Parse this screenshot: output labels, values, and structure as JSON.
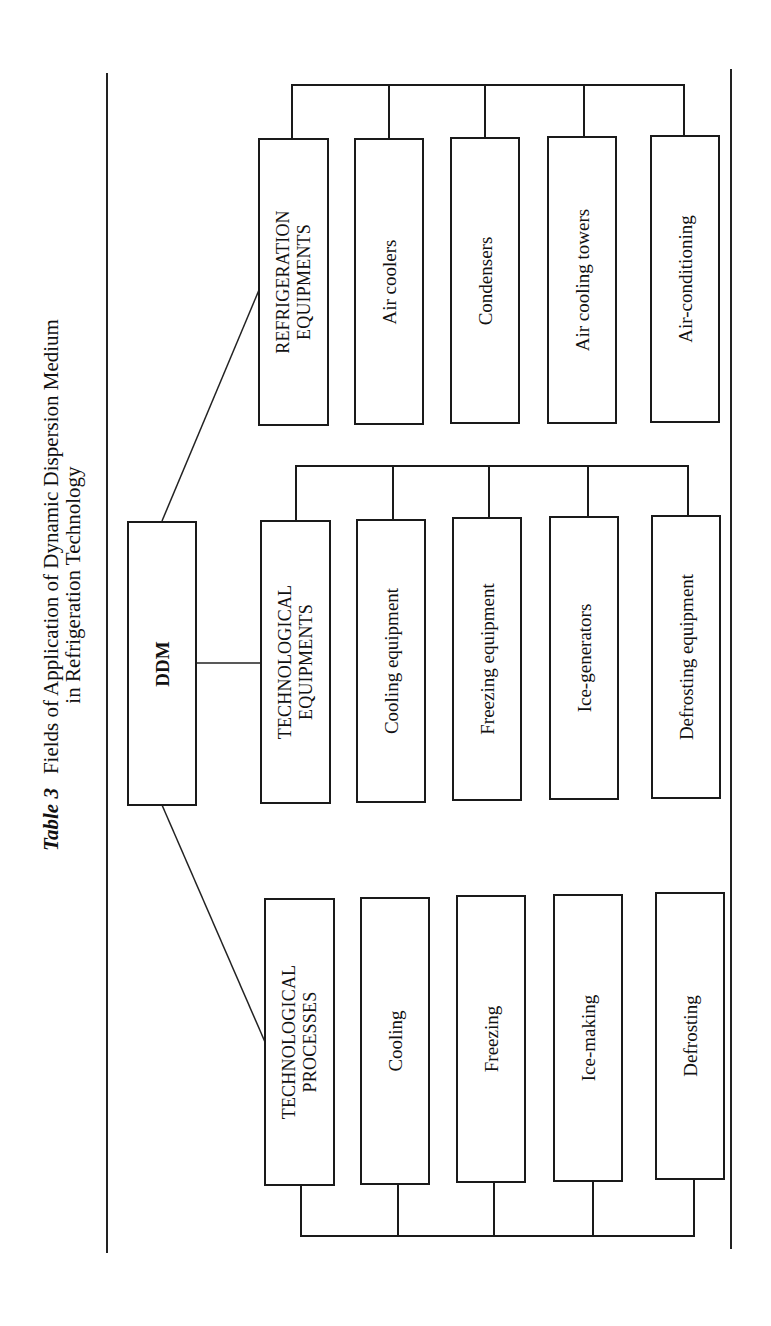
{
  "title": {
    "table_label": "Table 3",
    "line1": "Fields of Application of Dynamic Dispersion Medium",
    "line2": "in Refrigeration Technology"
  },
  "root": {
    "label": "DDM"
  },
  "groups": [
    {
      "id": "refrigeration",
      "header_line1": "REFRIGERATION",
      "header_line2": "EQUIPMENTS",
      "items": [
        "Air coolers",
        "Condensers",
        "Air cooling towers",
        "Air-conditioning"
      ]
    },
    {
      "id": "tech-equipments",
      "header_line1": "TECHNOLOGICAL",
      "header_line2": "EQUIPMENTS",
      "items": [
        "Cooling equipment",
        "Freezing equipment",
        "Ice-generators",
        "Defrosting equipment"
      ]
    },
    {
      "id": "tech-processes",
      "header_line1": "TECHNOLOGICAL",
      "header_line2": "PROCESSES",
      "items": [
        "Cooling",
        "Freezing",
        "Ice-making",
        "Defrosting"
      ]
    }
  ],
  "colors": {
    "line": "#1a1a1a",
    "background": "#ffffff",
    "text": "#111111"
  }
}
